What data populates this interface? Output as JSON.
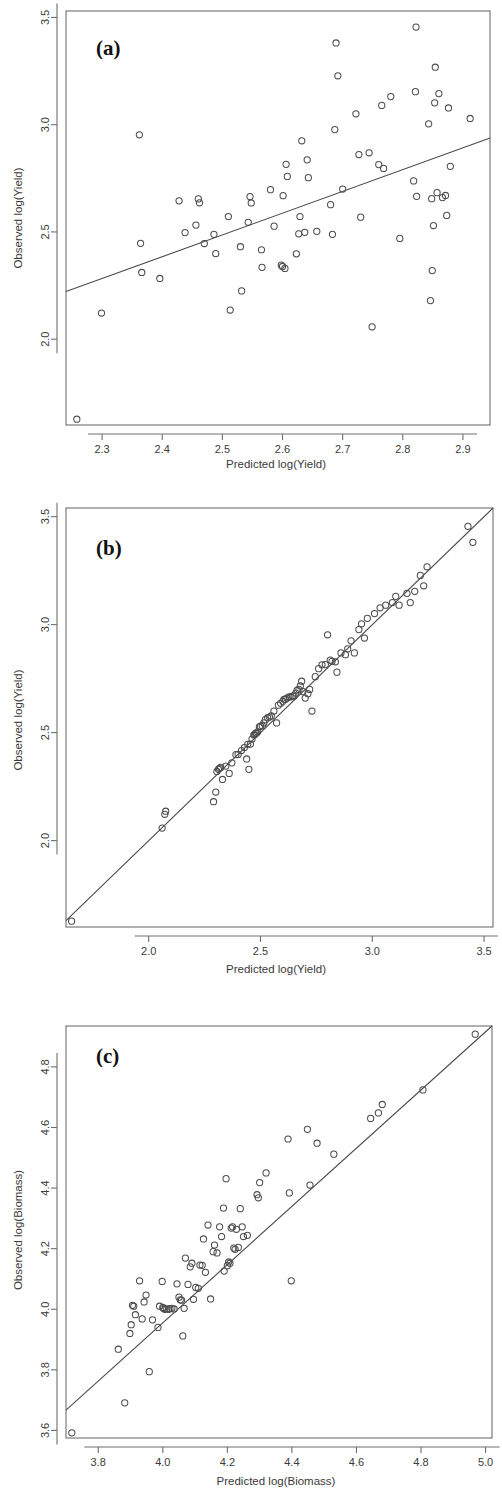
{
  "figure": {
    "panels": [
      {
        "id": "a",
        "letter": "(a)",
        "xlabel": "Predicted log(Yield)",
        "ylabel": "Observed log(Yield)"
      },
      {
        "id": "b",
        "letter": "(b)",
        "xlabel": "Predicted log(Yield)",
        "ylabel": "Observed log(Yield)"
      },
      {
        "id": "c",
        "letter": "(c)",
        "xlabel": "Predicted log(Biomass)",
        "ylabel": "Observed log(Biomass)"
      }
    ]
  },
  "chart_data": [
    {
      "type": "scatter",
      "panel": "a",
      "title": "(a)",
      "xlabel": "Predicted log(Yield)",
      "ylabel": "Observed log(Yield)",
      "xticks": [
        2.3,
        2.4,
        2.5,
        2.6,
        2.7,
        2.8,
        2.9
      ],
      "yticks": [
        2.0,
        2.5,
        3.0,
        3.5
      ],
      "xlim": [
        2.24,
        2.945
      ],
      "ylim": [
        1.6,
        3.53
      ],
      "grid": false,
      "legend": "none",
      "marker": "open-circle",
      "fit_line": {
        "type": "regression",
        "x": [
          2.24,
          2.945
        ],
        "y": [
          2.222,
          2.938
        ]
      },
      "points": [
        [
          2.258,
          1.627
        ],
        [
          2.299,
          2.122
        ],
        [
          2.362,
          2.953
        ],
        [
          2.364,
          2.447
        ],
        [
          2.366,
          2.311
        ],
        [
          2.396,
          2.283
        ],
        [
          2.428,
          2.645
        ],
        [
          2.438,
          2.497
        ],
        [
          2.456,
          2.532
        ],
        [
          2.46,
          2.654
        ],
        [
          2.462,
          2.636
        ],
        [
          2.47,
          2.446
        ],
        [
          2.486,
          2.489
        ],
        [
          2.489,
          2.399
        ],
        [
          2.51,
          2.572
        ],
        [
          2.513,
          2.136
        ],
        [
          2.53,
          2.431
        ],
        [
          2.532,
          2.225
        ],
        [
          2.543,
          2.545
        ],
        [
          2.546,
          2.665
        ],
        [
          2.548,
          2.635
        ],
        [
          2.565,
          2.417
        ],
        [
          2.566,
          2.335
        ],
        [
          2.58,
          2.697
        ],
        [
          2.586,
          2.527
        ],
        [
          2.598,
          2.345
        ],
        [
          2.6,
          2.339
        ],
        [
          2.601,
          2.669
        ],
        [
          2.604,
          2.33
        ],
        [
          2.606,
          2.815
        ],
        [
          2.608,
          2.759
        ],
        [
          2.623,
          2.398
        ],
        [
          2.627,
          2.491
        ],
        [
          2.629,
          2.572
        ],
        [
          2.632,
          2.925
        ],
        [
          2.637,
          2.498
        ],
        [
          2.641,
          2.836
        ],
        [
          2.643,
          2.753
        ],
        [
          2.657,
          2.503
        ],
        [
          2.68,
          2.627
        ],
        [
          2.683,
          2.489
        ],
        [
          2.687,
          2.977
        ],
        [
          2.689,
          3.381
        ],
        [
          2.692,
          3.228
        ],
        [
          2.7,
          2.7
        ],
        [
          2.722,
          3.051
        ],
        [
          2.727,
          2.861
        ],
        [
          2.73,
          2.569
        ],
        [
          2.744,
          2.869
        ],
        [
          2.749,
          2.058
        ],
        [
          2.76,
          2.814
        ],
        [
          2.765,
          3.09
        ],
        [
          2.768,
          2.796
        ],
        [
          2.78,
          3.131
        ],
        [
          2.795,
          2.47
        ],
        [
          2.818,
          2.738
        ],
        [
          2.821,
          3.154
        ],
        [
          2.822,
          3.455
        ],
        [
          2.823,
          2.666
        ],
        [
          2.843,
          3.004
        ],
        [
          2.846,
          2.18
        ],
        [
          2.848,
          2.655
        ],
        [
          2.849,
          2.32
        ],
        [
          2.851,
          2.53
        ],
        [
          2.853,
          3.102
        ],
        [
          2.854,
          3.268
        ],
        [
          2.857,
          2.683
        ],
        [
          2.86,
          3.145
        ],
        [
          2.866,
          2.66
        ],
        [
          2.871,
          2.67
        ],
        [
          2.873,
          2.577
        ],
        [
          2.876,
          3.078
        ],
        [
          2.879,
          2.806
        ],
        [
          2.912,
          3.029
        ]
      ]
    },
    {
      "type": "scatter",
      "panel": "b",
      "title": "(b)",
      "xlabel": "Predicted log(Yield)",
      "ylabel": "Observed log(Yield)",
      "xticks": [
        2.0,
        2.5,
        3.0,
        3.5
      ],
      "yticks": [
        2.0,
        2.5,
        3.0,
        3.5
      ],
      "xlim": [
        1.63,
        3.54
      ],
      "ylim": [
        1.6,
        3.54
      ],
      "grid": false,
      "legend": "none",
      "marker": "open-circle",
      "fit_line": {
        "type": "identity",
        "x": [
          1.63,
          3.54
        ],
        "y": [
          1.63,
          3.54
        ]
      },
      "points": [
        [
          1.655,
          1.627
        ],
        [
          2.06,
          2.058
        ],
        [
          2.072,
          2.122
        ],
        [
          2.076,
          2.136
        ],
        [
          2.29,
          2.18
        ],
        [
          2.3,
          2.225
        ],
        [
          2.305,
          2.32
        ],
        [
          2.312,
          2.33
        ],
        [
          2.316,
          2.335
        ],
        [
          2.322,
          2.339
        ],
        [
          2.33,
          2.283
        ],
        [
          2.345,
          2.345
        ],
        [
          2.36,
          2.311
        ],
        [
          2.372,
          2.36
        ],
        [
          2.39,
          2.398
        ],
        [
          2.4,
          2.399
        ],
        [
          2.415,
          2.417
        ],
        [
          2.428,
          2.431
        ],
        [
          2.438,
          2.378
        ],
        [
          2.443,
          2.446
        ],
        [
          2.448,
          2.33
        ],
        [
          2.455,
          2.447
        ],
        [
          2.462,
          2.47
        ],
        [
          2.47,
          2.489
        ],
        [
          2.474,
          2.491
        ],
        [
          2.478,
          2.497
        ],
        [
          2.482,
          2.498
        ],
        [
          2.487,
          2.503
        ],
        [
          2.495,
          2.527
        ],
        [
          2.5,
          2.53
        ],
        [
          2.508,
          2.532
        ],
        [
          2.515,
          2.545
        ],
        [
          2.522,
          2.56
        ],
        [
          2.532,
          2.569
        ],
        [
          2.54,
          2.572
        ],
        [
          2.548,
          2.577
        ],
        [
          2.56,
          2.6
        ],
        [
          2.572,
          2.545
        ],
        [
          2.58,
          2.627
        ],
        [
          2.59,
          2.636
        ],
        [
          2.6,
          2.645
        ],
        [
          2.605,
          2.654
        ],
        [
          2.612,
          2.655
        ],
        [
          2.618,
          2.66
        ],
        [
          2.628,
          2.665
        ],
        [
          2.636,
          2.666
        ],
        [
          2.644,
          2.669
        ],
        [
          2.65,
          2.67
        ],
        [
          2.658,
          2.683
        ],
        [
          2.664,
          2.697
        ],
        [
          2.672,
          2.7
        ],
        [
          2.678,
          2.716
        ],
        [
          2.684,
          2.738
        ],
        [
          2.69,
          2.69
        ],
        [
          2.7,
          2.66
        ],
        [
          2.712,
          2.68
        ],
        [
          2.72,
          2.7
        ],
        [
          2.73,
          2.6
        ],
        [
          2.745,
          2.759
        ],
        [
          2.76,
          2.796
        ],
        [
          2.775,
          2.814
        ],
        [
          2.79,
          2.815
        ],
        [
          2.8,
          2.953
        ],
        [
          2.812,
          2.836
        ],
        [
          2.82,
          2.83
        ],
        [
          2.835,
          2.828
        ],
        [
          2.842,
          2.78
        ],
        [
          2.86,
          2.869
        ],
        [
          2.88,
          2.861
        ],
        [
          2.89,
          2.888
        ],
        [
          2.905,
          2.925
        ],
        [
          2.92,
          2.869
        ],
        [
          2.94,
          2.977
        ],
        [
          2.952,
          3.004
        ],
        [
          2.965,
          2.938
        ],
        [
          2.978,
          3.029
        ],
        [
          3.01,
          3.051
        ],
        [
          3.035,
          3.078
        ],
        [
          3.06,
          3.09
        ],
        [
          3.09,
          3.102
        ],
        [
          3.105,
          3.131
        ],
        [
          3.12,
          3.09
        ],
        [
          3.155,
          3.145
        ],
        [
          3.17,
          3.102
        ],
        [
          3.19,
          3.154
        ],
        [
          3.215,
          3.228
        ],
        [
          3.23,
          3.18
        ],
        [
          3.245,
          3.268
        ],
        [
          3.428,
          3.455
        ],
        [
          3.45,
          3.381
        ]
      ]
    },
    {
      "type": "scatter",
      "panel": "c",
      "title": "(c)",
      "xlabel": "Predicted log(Biomass)",
      "ylabel": "Observed log(Biomass)",
      "xticks": [
        3.8,
        4.0,
        4.2,
        4.4,
        4.6,
        4.8,
        5.0
      ],
      "yticks": [
        3.6,
        3.8,
        4.0,
        4.2,
        4.4,
        4.6,
        4.8
      ],
      "xlim": [
        3.7,
        5.02
      ],
      "ylim": [
        3.575,
        4.935
      ],
      "grid": false,
      "legend": "none",
      "marker": "open-circle",
      "fit_line": {
        "type": "identity",
        "x": [
          3.7,
          5.02
        ],
        "y": [
          3.667,
          4.935
        ]
      },
      "points": [
        [
          3.718,
          3.592
        ],
        [
          3.862,
          3.868
        ],
        [
          3.882,
          3.691
        ],
        [
          3.898,
          3.92
        ],
        [
          3.902,
          3.949
        ],
        [
          3.906,
          4.013
        ],
        [
          3.91,
          4.01
        ],
        [
          3.915,
          3.982
        ],
        [
          3.928,
          4.094
        ],
        [
          3.936,
          3.968
        ],
        [
          3.942,
          4.024
        ],
        [
          3.948,
          4.047
        ],
        [
          3.958,
          3.794
        ],
        [
          3.968,
          3.965
        ],
        [
          3.985,
          3.94
        ],
        [
          3.99,
          4.01
        ],
        [
          3.998,
          4.092
        ],
        [
          4.0,
          4.006
        ],
        [
          4.002,
          4.003
        ],
        [
          4.006,
          4.0
        ],
        [
          4.012,
          4.001
        ],
        [
          4.018,
          4.0
        ],
        [
          4.022,
          4.002
        ],
        [
          4.028,
          4.003
        ],
        [
          4.035,
          4.001
        ],
        [
          4.044,
          4.084
        ],
        [
          4.05,
          4.04
        ],
        [
          4.054,
          4.031
        ],
        [
          4.058,
          4.03
        ],
        [
          4.062,
          3.912
        ],
        [
          4.066,
          4.003
        ],
        [
          4.07,
          4.169
        ],
        [
          4.078,
          4.082
        ],
        [
          4.085,
          4.14
        ],
        [
          4.09,
          4.152
        ],
        [
          4.095,
          4.033
        ],
        [
          4.102,
          4.072
        ],
        [
          4.11,
          4.069
        ],
        [
          4.115,
          4.146
        ],
        [
          4.122,
          4.145
        ],
        [
          4.126,
          4.232
        ],
        [
          4.132,
          4.122
        ],
        [
          4.14,
          4.278
        ],
        [
          4.148,
          4.034
        ],
        [
          4.156,
          4.19
        ],
        [
          4.16,
          4.212
        ],
        [
          4.168,
          4.186
        ],
        [
          4.176,
          4.272
        ],
        [
          4.182,
          4.24
        ],
        [
          4.188,
          4.334
        ],
        [
          4.19,
          4.126
        ],
        [
          4.196,
          4.431
        ],
        [
          4.2,
          4.144
        ],
        [
          4.204,
          4.156
        ],
        [
          4.208,
          4.152
        ],
        [
          4.212,
          4.268
        ],
        [
          4.216,
          4.272
        ],
        [
          4.22,
          4.202
        ],
        [
          4.224,
          4.198
        ],
        [
          4.228,
          4.264
        ],
        [
          4.234,
          4.204
        ],
        [
          4.24,
          4.332
        ],
        [
          4.246,
          4.272
        ],
        [
          4.25,
          4.24
        ],
        [
          4.262,
          4.244
        ],
        [
          4.292,
          4.378
        ],
        [
          4.296,
          4.368
        ],
        [
          4.3,
          4.418
        ],
        [
          4.32,
          4.45
        ],
        [
          4.388,
          4.562
        ],
        [
          4.392,
          4.384
        ],
        [
          4.398,
          4.094
        ],
        [
          4.448,
          4.594
        ],
        [
          4.456,
          4.41
        ],
        [
          4.478,
          4.548
        ],
        [
          4.53,
          4.512
        ],
        [
          4.644,
          4.63
        ],
        [
          4.668,
          4.648
        ],
        [
          4.68,
          4.676
        ],
        [
          4.806,
          4.724
        ],
        [
          4.968,
          4.908
        ]
      ]
    }
  ]
}
